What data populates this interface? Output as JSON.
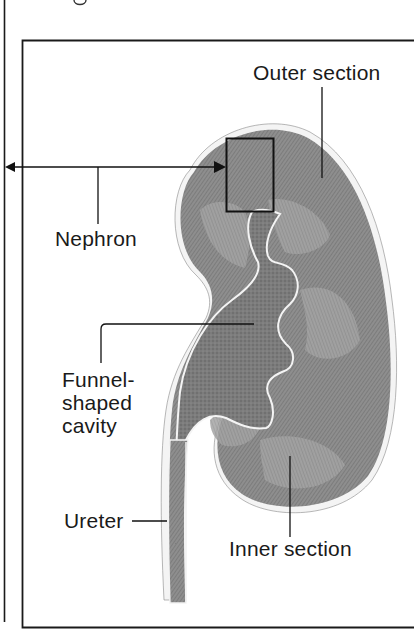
{
  "figure": {
    "partial_top_glyph": "g",
    "labels": {
      "outer_section": "Outer section",
      "nephron": "Nephron",
      "funnel_cavity": "Funnel-\nshaped\ncavity",
      "ureter": "Ureter",
      "inner_section": "Inner section"
    }
  },
  "colors": {
    "ink": "#1a1a1a",
    "kidney_fill": "#8f8f8f",
    "kidney_dark": "#6e6e6e",
    "kidney_light": "#b5b5b5",
    "capsule_highlight": "#f2f2f2",
    "background": "#ffffff"
  }
}
